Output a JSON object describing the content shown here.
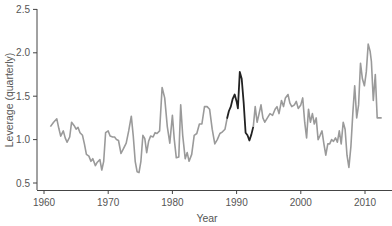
{
  "chart_data": {
    "type": "line",
    "title": "",
    "xlabel": "Year",
    "ylabel": "Leverage (quarterly)",
    "xlim": [
      1960,
      2013
    ],
    "ylim": [
      0.5,
      2.5
    ],
    "xticks": [
      1960,
      1970,
      1980,
      1990,
      2000,
      2010
    ],
    "yticks": [
      0.5,
      1.0,
      1.5,
      2.0,
      2.5
    ],
    "xtick_labels": [
      "1960",
      "1970",
      "1980",
      "1990",
      "2000",
      "2010"
    ],
    "ytick_labels": [
      "0.5",
      "1.0",
      "1.5",
      "2.0",
      "2.5"
    ],
    "grid": false,
    "legend": null,
    "colors": {
      "series": "#9a9a9a",
      "highlight": "#222222",
      "axis": "#444444",
      "text": "#555555"
    },
    "series": [
      {
        "name": "Leverage",
        "color": "#9a9a9a",
        "points": [
          [
            1961.0,
            1.15
          ],
          [
            1961.5,
            1.2
          ],
          [
            1962.0,
            1.24
          ],
          [
            1962.3,
            1.13
          ],
          [
            1962.6,
            1.04
          ],
          [
            1963.0,
            1.1
          ],
          [
            1963.3,
            1.02
          ],
          [
            1963.6,
            0.97
          ],
          [
            1964.0,
            1.03
          ],
          [
            1964.3,
            1.2
          ],
          [
            1964.7,
            1.16
          ],
          [
            1965.0,
            1.12
          ],
          [
            1965.3,
            1.14
          ],
          [
            1965.6,
            1.08
          ],
          [
            1966.0,
            1.05
          ],
          [
            1966.3,
            0.95
          ],
          [
            1966.6,
            0.83
          ],
          [
            1967.0,
            0.81
          ],
          [
            1967.3,
            0.75
          ],
          [
            1967.6,
            0.78
          ],
          [
            1968.0,
            0.7
          ],
          [
            1968.3,
            0.74
          ],
          [
            1968.7,
            0.77
          ],
          [
            1969.0,
            0.65
          ],
          [
            1969.3,
            0.75
          ],
          [
            1969.6,
            1.08
          ],
          [
            1970.0,
            1.1
          ],
          [
            1970.3,
            1.04
          ],
          [
            1970.7,
            1.03
          ],
          [
            1971.0,
            1.03
          ],
          [
            1971.3,
            1.0
          ],
          [
            1971.6,
            0.99
          ],
          [
            1972.0,
            0.84
          ],
          [
            1972.4,
            0.9
          ],
          [
            1972.8,
            0.96
          ],
          [
            1973.2,
            1.1
          ],
          [
            1973.6,
            1.27
          ],
          [
            1973.9,
            1.05
          ],
          [
            1974.2,
            0.75
          ],
          [
            1974.5,
            0.63
          ],
          [
            1974.8,
            0.62
          ],
          [
            1975.1,
            0.75
          ],
          [
            1975.4,
            1.05
          ],
          [
            1975.7,
            1.01
          ],
          [
            1976.0,
            0.85
          ],
          [
            1976.3,
            0.98
          ],
          [
            1976.6,
            1.04
          ],
          [
            1977.0,
            1.03
          ],
          [
            1977.3,
            1.08
          ],
          [
            1977.6,
            1.07
          ],
          [
            1978.0,
            1.1
          ],
          [
            1978.4,
            1.6
          ],
          [
            1978.8,
            1.48
          ],
          [
            1979.2,
            1.15
          ],
          [
            1979.6,
            0.96
          ],
          [
            1980.0,
            1.28
          ],
          [
            1980.3,
            1.0
          ],
          [
            1980.6,
            0.79
          ],
          [
            1981.0,
            0.8
          ],
          [
            1981.3,
            1.4
          ],
          [
            1981.6,
            1.05
          ],
          [
            1982.0,
            0.78
          ],
          [
            1982.3,
            0.85
          ],
          [
            1982.6,
            0.75
          ],
          [
            1983.0,
            0.83
          ],
          [
            1983.4,
            1.05
          ],
          [
            1983.8,
            1.07
          ],
          [
            1984.2,
            1.18
          ],
          [
            1984.6,
            1.18
          ],
          [
            1985.0,
            1.38
          ],
          [
            1985.4,
            1.38
          ],
          [
            1985.8,
            1.35
          ],
          [
            1986.2,
            1.12
          ],
          [
            1986.6,
            0.95
          ],
          [
            1987.0,
            1.0
          ],
          [
            1987.4,
            1.07
          ],
          [
            1987.8,
            1.09
          ],
          [
            1988.2,
            1.12
          ],
          [
            1988.5,
            1.24
          ]
        ]
      },
      {
        "name": "Leverage (highlighted 1988–1992)",
        "color": "#222222",
        "points": [
          [
            1988.5,
            1.24
          ],
          [
            1988.8,
            1.33
          ],
          [
            1989.1,
            1.38
          ],
          [
            1989.4,
            1.47
          ],
          [
            1989.7,
            1.52
          ],
          [
            1990.0,
            1.44
          ],
          [
            1990.2,
            1.36
          ],
          [
            1990.5,
            1.78
          ],
          [
            1990.8,
            1.7
          ],
          [
            1991.1,
            1.42
          ],
          [
            1991.4,
            1.08
          ],
          [
            1991.7,
            1.05
          ],
          [
            1992.0,
            0.99
          ],
          [
            1992.3,
            1.06
          ],
          [
            1992.6,
            1.15
          ]
        ]
      },
      {
        "name": "Leverage (continued)",
        "color": "#9a9a9a",
        "points": [
          [
            1992.6,
            1.15
          ],
          [
            1992.9,
            1.38
          ],
          [
            1993.2,
            1.2
          ],
          [
            1993.5,
            1.3
          ],
          [
            1993.8,
            1.4
          ],
          [
            1994.1,
            1.25
          ],
          [
            1994.4,
            1.2
          ],
          [
            1994.8,
            1.25
          ],
          [
            1995.2,
            1.3
          ],
          [
            1995.6,
            1.28
          ],
          [
            1996.0,
            1.35
          ],
          [
            1996.3,
            1.38
          ],
          [
            1996.6,
            1.3
          ],
          [
            1997.0,
            1.45
          ],
          [
            1997.3,
            1.38
          ],
          [
            1997.6,
            1.48
          ],
          [
            1998.0,
            1.52
          ],
          [
            1998.3,
            1.42
          ],
          [
            1998.6,
            1.38
          ],
          [
            1999.0,
            1.4
          ],
          [
            1999.3,
            1.44
          ],
          [
            1999.6,
            1.36
          ],
          [
            2000.0,
            1.4
          ],
          [
            2000.3,
            1.48
          ],
          [
            2000.6,
            1.2
          ],
          [
            2000.9,
            1.02
          ],
          [
            2001.2,
            1.35
          ],
          [
            2001.5,
            1.2
          ],
          [
            2001.8,
            1.3
          ],
          [
            2002.1,
            1.18
          ],
          [
            2002.4,
            1.25
          ],
          [
            2002.7,
            1.0
          ],
          [
            2003.0,
            1.05
          ],
          [
            2003.3,
            1.1
          ],
          [
            2003.6,
            0.95
          ],
          [
            2003.9,
            0.82
          ],
          [
            2004.2,
            0.95
          ],
          [
            2004.5,
            0.95
          ],
          [
            2004.8,
            1.0
          ],
          [
            2005.1,
            0.98
          ],
          [
            2005.4,
            1.02
          ],
          [
            2005.7,
            0.97
          ],
          [
            2006.0,
            1.1
          ],
          [
            2006.3,
            0.95
          ],
          [
            2006.6,
            1.2
          ],
          [
            2006.9,
            1.12
          ],
          [
            2007.2,
            0.82
          ],
          [
            2007.5,
            0.68
          ],
          [
            2007.8,
            0.92
          ],
          [
            2008.1,
            1.3
          ],
          [
            2008.4,
            1.62
          ],
          [
            2008.7,
            1.25
          ],
          [
            2009.0,
            1.4
          ],
          [
            2009.3,
            1.88
          ],
          [
            2009.6,
            1.7
          ],
          [
            2009.9,
            1.62
          ],
          [
            2010.2,
            1.78
          ],
          [
            2010.5,
            2.1
          ],
          [
            2010.8,
            2.02
          ],
          [
            2011.0,
            1.9
          ],
          [
            2011.3,
            1.45
          ],
          [
            2011.6,
            1.75
          ],
          [
            2011.9,
            1.25
          ],
          [
            2012.2,
            1.25
          ],
          [
            2012.6,
            1.25
          ]
        ]
      }
    ]
  },
  "axes": {
    "xlabel": "Year",
    "ylabel": "Leverage (quarterly)",
    "xtick_labels": [
      "1960",
      "1970",
      "1980",
      "1990",
      "2000",
      "2010"
    ],
    "ytick_labels": [
      "0.5",
      "1.0",
      "1.5",
      "2.0",
      "2.5"
    ]
  }
}
